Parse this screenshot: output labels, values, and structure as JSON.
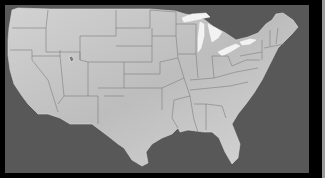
{
  "map": {
    "subject": "Contiguous United States state boundaries",
    "style": "grayscale relief",
    "colors": {
      "frame": "#000000",
      "ocean": "#585858",
      "land": "#c9c9c9",
      "state_borders": "#7d7d7d",
      "great_lakes": "#f2f2f2",
      "right_edge": "#9a9a9a"
    }
  }
}
